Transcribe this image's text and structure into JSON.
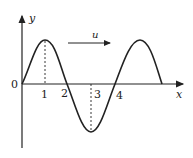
{
  "diagram": {
    "type": "transverse wave snapshot",
    "axes": {
      "x_label": "x",
      "y_label": "y",
      "origin_label": "0"
    },
    "tick_labels": [
      "1",
      "2",
      "3",
      "4"
    ],
    "velocity_label": "u",
    "colors": {
      "stroke": "#222222",
      "background": "#ffffff"
    }
  }
}
